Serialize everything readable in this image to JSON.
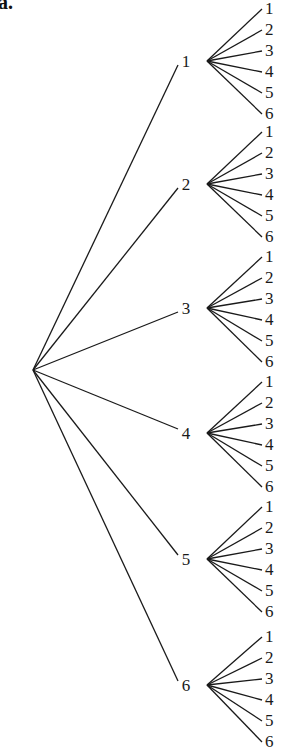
{
  "figure": {
    "part_label": "a.",
    "root": {
      "x": 33,
      "y": 370
    },
    "level1": [
      {
        "label": "1",
        "label_x": 186,
        "y": 61,
        "branch_x": 207,
        "leaves_start_y": 8
      },
      {
        "label": "2",
        "label_x": 186,
        "y": 184,
        "branch_x": 207,
        "leaves_start_y": 131
      },
      {
        "label": "3",
        "label_x": 186,
        "y": 308,
        "branch_x": 207,
        "leaves_start_y": 256
      },
      {
        "label": "4",
        "label_x": 186,
        "y": 433,
        "branch_x": 207,
        "leaves_start_y": 381
      },
      {
        "label": "5",
        "label_x": 186,
        "y": 559,
        "branch_x": 207,
        "leaves_start_y": 506
      },
      {
        "label": "6",
        "label_x": 186,
        "y": 685,
        "branch_x": 207,
        "leaves_start_y": 636
      }
    ],
    "leaf_labels": [
      "1",
      "2",
      "3",
      "4",
      "5",
      "6"
    ],
    "leaf_spacing": 21,
    "leaf_line_end_x": 262,
    "leaf_label_x": 265,
    "root_line_end_x": 177,
    "line_color": "#1a1a1a"
  }
}
